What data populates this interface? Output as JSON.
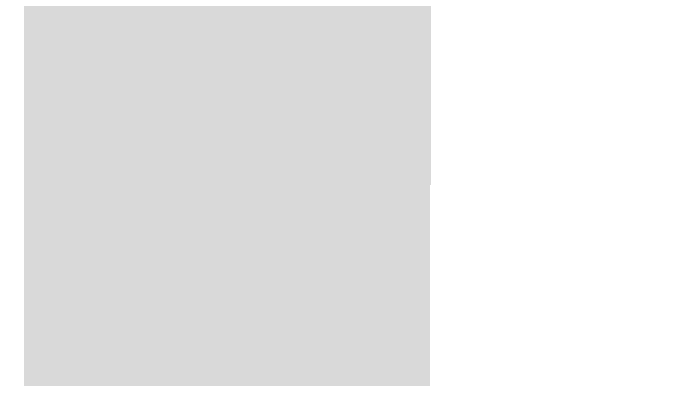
{
  "figure": {
    "type": "histology-diagram",
    "frame_color": "#d9d9d9",
    "background_color": "#ffffff",
    "ink_color": "#1c1c1c"
  },
  "labels": [
    {
      "id": "stratum-corneum",
      "line1": "Stratum",
      "line2": "corneum"
    },
    {
      "id": "stratum-granulosum",
      "line1": "Stratum",
      "line2": "granulosum"
    },
    {
      "id": "stratum-germinativum",
      "line1": "Stratum",
      "line2": "germinativum"
    },
    {
      "id": "papillary-layer",
      "line1": "Papillary  layer",
      "line2": "of dermis"
    }
  ]
}
